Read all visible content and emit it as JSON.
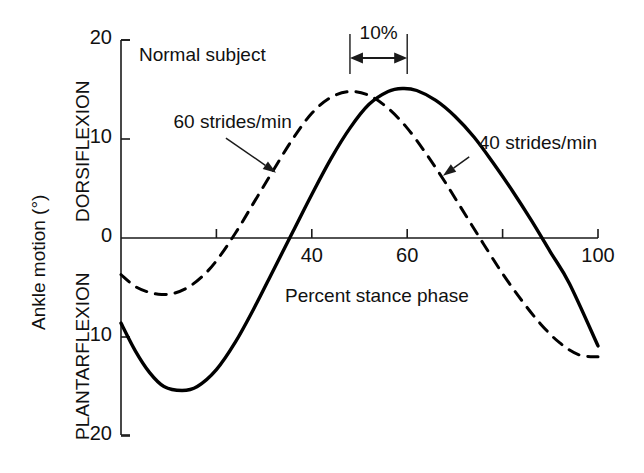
{
  "chart_data": {
    "type": "line",
    "title": "",
    "annotation_title": "Normal subject",
    "xlabel": "Percent stance phase",
    "ylabel": "Ankle motion (°)",
    "ylabel_upper": "DORSIFLEXION",
    "ylabel_lower": "PLANTARFLEXION",
    "xlim": [
      0,
      100
    ],
    "ylim": [
      -20,
      20
    ],
    "xticks": [
      0,
      20,
      40,
      60,
      80,
      100
    ],
    "xtick_labels": [
      "",
      "",
      "40",
      "60",
      "",
      "100"
    ],
    "yticks": [
      -20,
      -10,
      0,
      10,
      20
    ],
    "ytick_labels": [
      "20",
      "10",
      "0",
      "10",
      "20"
    ],
    "grid": false,
    "legend_position": "inline-annotations",
    "zero_line": true,
    "span_annotation": {
      "label": "10%",
      "x_start": 48,
      "x_end": 60
    },
    "series": [
      {
        "name": "40 strides/min",
        "style": "solid",
        "color": "#000000",
        "label_x": 75,
        "label_y": 9.5,
        "arrow_from_x": 73,
        "arrow_from_y": 8.2,
        "arrow_to_x": 67.5,
        "arrow_to_y": 6.3,
        "x": [
          0,
          3,
          6,
          9,
          12.8,
          16,
          20,
          24,
          28,
          32,
          36,
          40,
          44,
          48,
          52,
          56,
          59,
          62,
          66,
          70,
          74,
          78,
          82,
          86,
          90,
          94,
          100
        ],
        "y": [
          -8.6,
          -11.4,
          -13.6,
          -15.0,
          -15.4,
          -15.0,
          -13.3,
          -10.5,
          -7.0,
          -3.2,
          0.6,
          4.4,
          8.0,
          11.1,
          13.5,
          14.8,
          15.1,
          14.9,
          13.9,
          12.3,
          10.2,
          7.6,
          4.8,
          1.8,
          -1.4,
          -4.6,
          -10.9
        ]
      },
      {
        "name": "60 strides/min",
        "style": "dashed",
        "color": "#000000",
        "label_x": 11,
        "label_y": 11.6,
        "arrow_from_x": 22,
        "arrow_from_y": 10.1,
        "arrow_to_x": 32.5,
        "arrow_to_y": 6.6,
        "x": [
          0,
          3,
          6,
          8.5,
          11,
          14,
          17,
          20,
          24,
          28,
          32,
          36,
          40,
          44,
          48,
          52,
          56,
          60,
          64,
          68,
          72,
          76,
          80,
          84,
          88,
          92,
          96,
          100
        ],
        "y": [
          -3.7,
          -4.9,
          -5.5,
          -5.7,
          -5.6,
          -5.0,
          -3.9,
          -2.3,
          0.5,
          3.7,
          6.9,
          10.0,
          12.6,
          14.2,
          14.8,
          14.4,
          13.1,
          11.1,
          8.5,
          5.6,
          2.5,
          -0.6,
          -3.6,
          -6.3,
          -8.7,
          -10.6,
          -11.8,
          -12.0
        ]
      }
    ]
  },
  "axes_geometry": {
    "left_px": 121,
    "right_px": 598,
    "zero_px": 238,
    "top_px": 40,
    "bottom_px": 435
  }
}
